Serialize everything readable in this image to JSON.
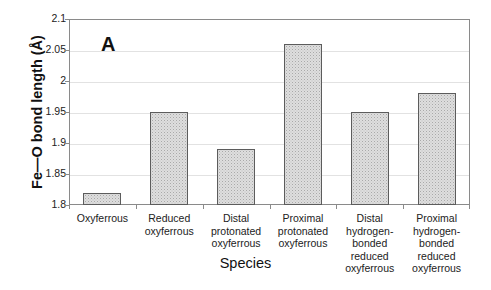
{
  "chart_data": {
    "type": "bar",
    "title": "",
    "panel_label": "A",
    "xlabel": "Species",
    "ylabel": "Fe—O bond length (Å)",
    "ylim": [
      1.8,
      2.1
    ],
    "ytick_values": [
      "2.1",
      "2.05",
      "2",
      "1.95",
      "1.9",
      "1.85",
      "1.8"
    ],
    "grid": true,
    "legend": "none",
    "categories": [
      "Oxyferrous",
      "Reduced oxyferrous",
      "Distal protonated oxyferrous",
      "Proximal protonated oxyferrous",
      "Distal hydrogen-bonded reduced oxyferrous",
      "Proximal hydrogen-bonded reduced oxyferrous"
    ],
    "category_label_lines": [
      [
        "Oxyferrous"
      ],
      [
        "Reduced",
        "oxyferrous"
      ],
      [
        "Distal",
        "protonated",
        "oxyferrous"
      ],
      [
        "Proximal",
        "protonated",
        "oxyferrous"
      ],
      [
        "Distal",
        "hydrogen-",
        "bonded",
        "reduced",
        "oxyferrous"
      ],
      [
        "Proximal",
        "hydrogen-",
        "bonded",
        "reduced",
        "oxyferrous"
      ]
    ],
    "values": [
      1.82,
      1.95,
      1.89,
      2.06,
      1.95,
      1.98
    ],
    "bar_fill_color": "#dedede",
    "bar_border_color": "#5c5c5c",
    "axis_color": "#8a8a8a",
    "grid_color": "#e2e2e2"
  }
}
